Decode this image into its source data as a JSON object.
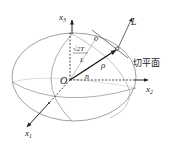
{
  "diagram": {
    "type": "ellipsoid-geometry",
    "origin_label": "O",
    "axes": [
      {
        "id": "x1",
        "label": "x",
        "sub": "1"
      },
      {
        "id": "x2",
        "label": "x",
        "sub": "2"
      },
      {
        "id": "x3",
        "label": "x",
        "sub": "3"
      }
    ],
    "vectors": {
      "rho": "ρ",
      "n": "n",
      "L": "L"
    },
    "annotations": {
      "sqrt_label": "√2T",
      "fraction_denominator": "L",
      "tangent_plane": "切平面"
    },
    "colors": {
      "stroke": "#333333",
      "ellipse": "#666666",
      "background": "#ffffff"
    }
  }
}
